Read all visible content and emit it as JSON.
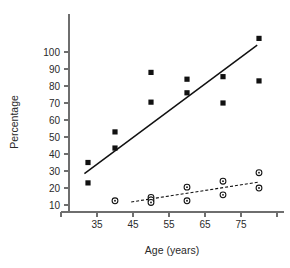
{
  "chart_data": {
    "type": "scatter",
    "title": "",
    "xlabel": "Age (years)",
    "ylabel": "Percentage",
    "xlim": [
      30,
      88
    ],
    "ylim": [
      6,
      112
    ],
    "xticks": [
      35,
      45,
      55,
      65,
      75,
      85
    ],
    "xtick_labels": [
      "35",
      "45",
      "55",
      "65",
      "75",
      ""
    ],
    "yticks": [
      10,
      20,
      30,
      40,
      50,
      60,
      70,
      80,
      90,
      100
    ],
    "ytick_labels": [
      "10",
      "20",
      "30",
      "40",
      "50",
      "60",
      "70",
      "80",
      "90",
      "100"
    ],
    "grid": false,
    "legend": "none",
    "series": [
      {
        "name": "filled-squares",
        "marker": "square",
        "marker_color": "#111111",
        "points": [
          {
            "x": 32.5,
            "y": 35
          },
          {
            "x": 32.5,
            "y": 23
          },
          {
            "x": 40,
            "y": 53
          },
          {
            "x": 40,
            "y": 43.5
          },
          {
            "x": 50,
            "y": 88
          },
          {
            "x": 50,
            "y": 70.5
          },
          {
            "x": 60,
            "y": 84
          },
          {
            "x": 60,
            "y": 76
          },
          {
            "x": 70,
            "y": 85.5
          },
          {
            "x": 70,
            "y": 70
          },
          {
            "x": 80,
            "y": 108
          },
          {
            "x": 80,
            "y": 83
          }
        ],
        "trendline": {
          "style": "solid",
          "x_start": 31.5,
          "y_start": 28.5,
          "x_end": 79.5,
          "y_end": 104
        }
      },
      {
        "name": "open-circles",
        "marker": "circle",
        "marker_color": "#111111",
        "points": [
          {
            "x": 40,
            "y": 12.5
          },
          {
            "x": 50,
            "y": 14.5
          },
          {
            "x": 50,
            "y": 13
          },
          {
            "x": 50,
            "y": 11.5
          },
          {
            "x": 60,
            "y": 20.5
          },
          {
            "x": 60,
            "y": 12.5
          },
          {
            "x": 70,
            "y": 24
          },
          {
            "x": 70,
            "y": 16
          },
          {
            "x": 80,
            "y": 29
          },
          {
            "x": 80,
            "y": 20
          }
        ],
        "trendline": {
          "style": "dashed",
          "x_start": 44.5,
          "y_start": 11.8,
          "x_end": 80,
          "y_end": 23.5
        }
      }
    ]
  }
}
